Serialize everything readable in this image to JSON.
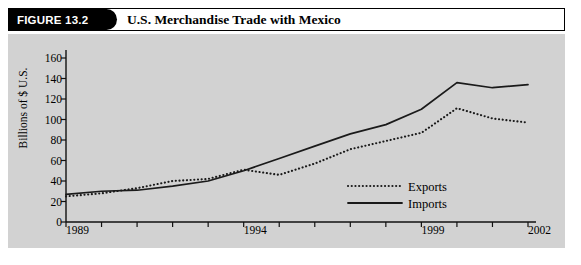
{
  "figure": {
    "tag_label": "FIGURE 13.2",
    "title": "U.S. Merchandise Trade with Mexico"
  },
  "chart_data": {
    "type": "line",
    "title": "U.S. Merchandise Trade with Mexico",
    "xlabel": "",
    "ylabel": "Billions of $ U.S.",
    "ylim": [
      0,
      160
    ],
    "xlim": [
      1989,
      2002
    ],
    "ytick_labels": [
      "0",
      "20",
      "40",
      "60",
      "80",
      "100",
      "120",
      "140",
      "160"
    ],
    "yticks": [
      0,
      20,
      40,
      60,
      80,
      100,
      120,
      140,
      160
    ],
    "xticks": [
      1989,
      1990,
      1991,
      1992,
      1993,
      1994,
      1995,
      1996,
      1997,
      1998,
      1999,
      2000,
      2001,
      2002
    ],
    "xtick_labels_shown": [
      "1989",
      "1994",
      "1999",
      "2002"
    ],
    "grid": false,
    "legend_position": "center-right",
    "x": [
      1989,
      1990,
      1991,
      1992,
      1993,
      1994,
      1995,
      1996,
      1997,
      1998,
      1999,
      2000,
      2001,
      2002
    ],
    "series": [
      {
        "name": "Exports",
        "style": "dotted",
        "color": "#1a1a1a",
        "values": [
          25,
          28,
          33,
          40,
          42,
          51,
          46,
          57,
          71,
          79,
          87,
          111,
          101,
          97
        ]
      },
      {
        "name": "Imports",
        "style": "solid",
        "color": "#1a1a1a",
        "values": [
          27,
          30,
          31,
          35,
          40,
          50,
          62,
          74,
          86,
          95,
          110,
          136,
          131,
          134
        ]
      }
    ]
  },
  "colors": {
    "panel_background": "#d2d2d2",
    "page_background": "#ffffff",
    "ink": "#000000",
    "tag_background": "#000000",
    "tag_text": "#ffffff"
  }
}
